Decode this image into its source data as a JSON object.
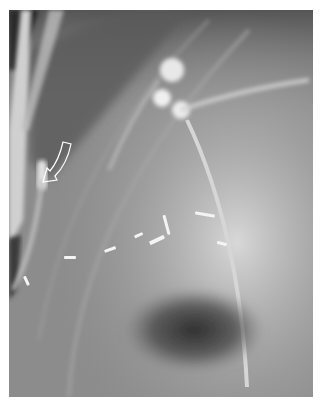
{
  "image": {
    "description": "Grayscale fluoroscopic radiograph showing contrast-filled structure with a drainage catheter, surgical clips, and a curved arrow annotation",
    "colors": {
      "background": "#ffffff",
      "film_mid": "#8a8a8a",
      "film_dark": "#2a2a2a",
      "film_light": "#e8e8e8"
    },
    "annotations": [
      {
        "type": "curved-arrow",
        "style": "white outline",
        "points_to": "catheter tip at left"
      }
    ],
    "features": [
      "contrast blob upper center",
      "long catheter descending to lower right",
      "scattered radiopaque surgical clips mid-image",
      "dark gas lucency lower center",
      "vertical bright tube at left edge"
    ]
  }
}
